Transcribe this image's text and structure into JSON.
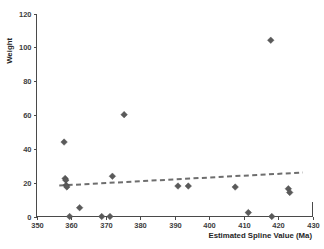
{
  "chart_data": {
    "type": "scatter",
    "title": "",
    "xlabel": "Estimated Spline Value (Ma)",
    "ylabel": "Weight",
    "xlim": [
      350,
      430
    ],
    "ylim": [
      0,
      120
    ],
    "xticks": [
      350,
      360,
      370,
      380,
      390,
      400,
      410,
      420,
      430
    ],
    "yticks": [
      0,
      20,
      40,
      60,
      80,
      100,
      120
    ],
    "grid": false,
    "legend": null,
    "marker_style": "filled-diamond",
    "marker_color": "#5a5a5a",
    "points": [
      {
        "x": 358.0,
        "y": 44.0
      },
      {
        "x": 358.3,
        "y": 22.5
      },
      {
        "x": 358.5,
        "y": 21.5
      },
      {
        "x": 358.6,
        "y": 18.5
      },
      {
        "x": 358.8,
        "y": 17.5
      },
      {
        "x": 359.6,
        "y": 0.0
      },
      {
        "x": 362.5,
        "y": 5.2
      },
      {
        "x": 368.9,
        "y": 0.0
      },
      {
        "x": 371.3,
        "y": 0.0
      },
      {
        "x": 372.0,
        "y": 23.8
      },
      {
        "x": 375.4,
        "y": 60.2
      },
      {
        "x": 391.0,
        "y": 18.0
      },
      {
        "x": 394.0,
        "y": 18.0
      },
      {
        "x": 407.6,
        "y": 17.4
      },
      {
        "x": 411.4,
        "y": 2.3
      },
      {
        "x": 417.9,
        "y": 104.2
      },
      {
        "x": 418.2,
        "y": 0.0
      },
      {
        "x": 423.0,
        "y": 16.4
      },
      {
        "x": 423.4,
        "y": 14.2
      }
    ],
    "trendline": {
      "style": "dashed",
      "color": "#6e6e6e",
      "x_start": 356.6,
      "y_start": 18.3,
      "x_end": 427.2,
      "y_end": 26.0
    }
  }
}
